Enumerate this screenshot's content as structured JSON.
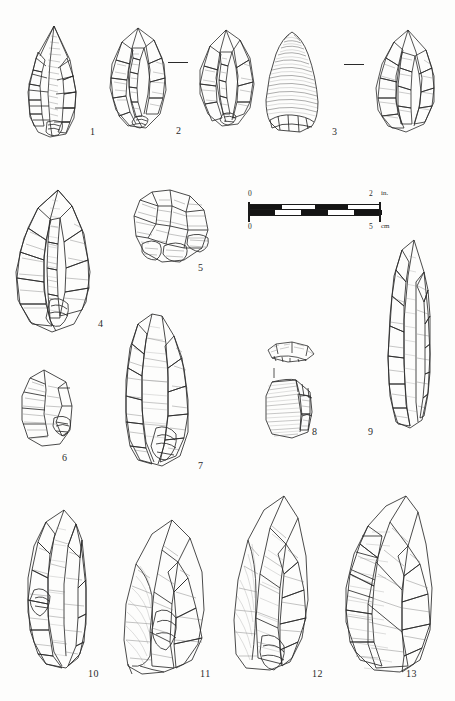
{
  "plate": {
    "title": "Lithic Artifact Plate",
    "background_color": "#fdfdfc",
    "ink_color": "#2a2a2a",
    "artifact_count": 13
  },
  "scale": {
    "inches": {
      "start_label": "0",
      "end_label": "2",
      "unit": "in."
    },
    "centimeters": {
      "start_label": "0",
      "end_label": "5",
      "unit": "cm"
    }
  },
  "figures": [
    {
      "number": "1",
      "label": "1",
      "name": "biface-point-leaf-shaped"
    },
    {
      "number": "2",
      "label": "2",
      "name": "biface-ovate-flaked"
    },
    {
      "number": "3",
      "label": "3",
      "name": "conical-core-bullet-shaped"
    },
    {
      "number": "4",
      "label": "4",
      "name": "biface-elongated-point"
    },
    {
      "number": "5",
      "label": "5",
      "name": "core-multiplatform"
    },
    {
      "number": "6",
      "label": "6",
      "name": "scraper-side-retouched"
    },
    {
      "number": "7",
      "label": "7",
      "name": "blade-elongated-retouched"
    },
    {
      "number": "8",
      "label": "8",
      "name": "core-fragment-two-views"
    },
    {
      "number": "9",
      "label": "9",
      "name": "blade-narrow-elongated"
    },
    {
      "number": "10",
      "label": "10",
      "name": "biface-narrow-point"
    },
    {
      "number": "11",
      "label": "11",
      "name": "flake-large-retouched"
    },
    {
      "number": "12",
      "label": "12",
      "name": "flake-triangular-retouched"
    },
    {
      "number": "13",
      "label": "13",
      "name": "flake-broad-retouched"
    }
  ],
  "separators": [
    {
      "name": "dash-between-2-and-3"
    },
    {
      "name": "dash-between-3-and-far-right"
    }
  ]
}
